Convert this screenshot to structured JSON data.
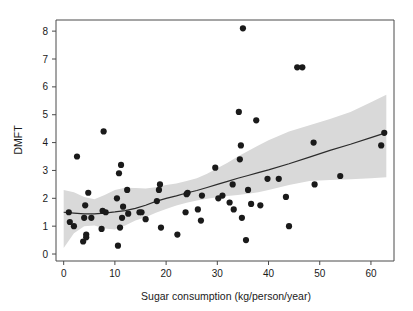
{
  "chart_data": {
    "type": "scatter",
    "title": "",
    "subtitle": "",
    "xlabel": "Sugar consumption (kg/person/year)",
    "ylabel": "DMFT",
    "xlim": [
      -1.5,
      64.5
    ],
    "ylim": [
      -0.25,
      8.4
    ],
    "xticks": [
      0,
      10,
      20,
      30,
      40,
      50,
      60
    ],
    "yticks": [
      0,
      1,
      2,
      3,
      4,
      5,
      6,
      7,
      8
    ],
    "xtick_labels": [
      "0",
      "10",
      "20",
      "30",
      "40",
      "50",
      "60"
    ],
    "ytick_labels": [
      "0",
      "1",
      "2",
      "3",
      "4",
      "5",
      "6",
      "7",
      "8"
    ],
    "grid": false,
    "legend": false,
    "legend_position": "none",
    "marker": {
      "shape": "circle",
      "color": "#1a1a1a",
      "size_px": 3.1
    },
    "points": [
      {
        "x": 1.0,
        "y": 1.5
      },
      {
        "x": 1.2,
        "y": 1.15
      },
      {
        "x": 2.0,
        "y": 1.0
      },
      {
        "x": 2.6,
        "y": 3.5
      },
      {
        "x": 3.8,
        "y": 0.45
      },
      {
        "x": 4.0,
        "y": 1.3
      },
      {
        "x": 4.2,
        "y": 1.75
      },
      {
        "x": 4.4,
        "y": 0.7
      },
      {
        "x": 4.4,
        "y": 0.6
      },
      {
        "x": 4.8,
        "y": 2.2
      },
      {
        "x": 5.4,
        "y": 1.3
      },
      {
        "x": 7.4,
        "y": 0.9
      },
      {
        "x": 7.6,
        "y": 1.55
      },
      {
        "x": 7.8,
        "y": 4.4
      },
      {
        "x": 8.2,
        "y": 1.5
      },
      {
        "x": 10.4,
        "y": 2.0
      },
      {
        "x": 10.6,
        "y": 0.3
      },
      {
        "x": 10.8,
        "y": 2.9
      },
      {
        "x": 11.0,
        "y": 0.95
      },
      {
        "x": 11.2,
        "y": 3.2
      },
      {
        "x": 11.4,
        "y": 1.3
      },
      {
        "x": 11.6,
        "y": 1.7
      },
      {
        "x": 12.4,
        "y": 2.3
      },
      {
        "x": 12.6,
        "y": 1.45
      },
      {
        "x": 14.8,
        "y": 1.5
      },
      {
        "x": 15.2,
        "y": 1.5
      },
      {
        "x": 16.0,
        "y": 1.25
      },
      {
        "x": 18.2,
        "y": 1.9
      },
      {
        "x": 18.6,
        "y": 2.3
      },
      {
        "x": 18.8,
        "y": 2.5
      },
      {
        "x": 19.0,
        "y": 0.95
      },
      {
        "x": 22.2,
        "y": 0.7
      },
      {
        "x": 23.8,
        "y": 1.5
      },
      {
        "x": 24.0,
        "y": 2.15
      },
      {
        "x": 24.2,
        "y": 2.2
      },
      {
        "x": 26.2,
        "y": 1.6
      },
      {
        "x": 26.8,
        "y": 1.2
      },
      {
        "x": 27.0,
        "y": 2.1
      },
      {
        "x": 29.6,
        "y": 3.1
      },
      {
        "x": 30.2,
        "y": 2.0
      },
      {
        "x": 31.0,
        "y": 2.1
      },
      {
        "x": 32.4,
        "y": 1.85
      },
      {
        "x": 33.0,
        "y": 2.5
      },
      {
        "x": 33.2,
        "y": 1.6
      },
      {
        "x": 34.2,
        "y": 5.1
      },
      {
        "x": 34.4,
        "y": 3.4
      },
      {
        "x": 34.6,
        "y": 3.9
      },
      {
        "x": 34.8,
        "y": 1.3
      },
      {
        "x": 35.0,
        "y": 8.1
      },
      {
        "x": 35.6,
        "y": 0.5
      },
      {
        "x": 36.0,
        "y": 2.3
      },
      {
        "x": 36.6,
        "y": 1.8
      },
      {
        "x": 37.6,
        "y": 4.8
      },
      {
        "x": 38.4,
        "y": 1.75
      },
      {
        "x": 39.8,
        "y": 2.7
      },
      {
        "x": 42.0,
        "y": 2.7
      },
      {
        "x": 43.4,
        "y": 2.05
      },
      {
        "x": 44.0,
        "y": 1.0
      },
      {
        "x": 45.6,
        "y": 6.7
      },
      {
        "x": 46.6,
        "y": 6.7
      },
      {
        "x": 48.8,
        "y": 4.0
      },
      {
        "x": 49.0,
        "y": 2.5
      },
      {
        "x": 54.0,
        "y": 2.8
      },
      {
        "x": 62.0,
        "y": 3.9
      },
      {
        "x": 62.6,
        "y": 4.35
      }
    ],
    "fit_curve": {
      "name": "loess-fit",
      "color": "#2b2b2b",
      "points": [
        {
          "x": 0.0,
          "y": 1.5
        },
        {
          "x": 2.0,
          "y": 1.47
        },
        {
          "x": 4.0,
          "y": 1.44
        },
        {
          "x": 6.0,
          "y": 1.44
        },
        {
          "x": 8.0,
          "y": 1.47
        },
        {
          "x": 10.0,
          "y": 1.51
        },
        {
          "x": 12.0,
          "y": 1.56
        },
        {
          "x": 14.0,
          "y": 1.64
        },
        {
          "x": 16.0,
          "y": 1.75
        },
        {
          "x": 18.0,
          "y": 1.89
        },
        {
          "x": 20.0,
          "y": 2.0
        },
        {
          "x": 22.0,
          "y": 2.09
        },
        {
          "x": 24.0,
          "y": 2.19
        },
        {
          "x": 26.0,
          "y": 2.28
        },
        {
          "x": 28.0,
          "y": 2.39
        },
        {
          "x": 30.0,
          "y": 2.5
        },
        {
          "x": 32.0,
          "y": 2.61
        },
        {
          "x": 34.0,
          "y": 2.72
        },
        {
          "x": 36.0,
          "y": 2.82
        },
        {
          "x": 38.0,
          "y": 2.92
        },
        {
          "x": 40.0,
          "y": 3.02
        },
        {
          "x": 44.0,
          "y": 3.24
        },
        {
          "x": 48.0,
          "y": 3.48
        },
        {
          "x": 52.0,
          "y": 3.72
        },
        {
          "x": 56.0,
          "y": 3.94
        },
        {
          "x": 60.0,
          "y": 4.18
        },
        {
          "x": 63.0,
          "y": 4.36
        }
      ]
    },
    "confidence_band": {
      "name": "confidence-band",
      "color": "#d9d9d9",
      "upper": [
        {
          "x": 0.0,
          "y": 2.3
        },
        {
          "x": 2.0,
          "y": 2.22
        },
        {
          "x": 4.0,
          "y": 2.05
        },
        {
          "x": 6.0,
          "y": 1.97
        },
        {
          "x": 8.0,
          "y": 2.12
        },
        {
          "x": 10.0,
          "y": 2.3
        },
        {
          "x": 12.0,
          "y": 2.38
        },
        {
          "x": 14.0,
          "y": 2.37
        },
        {
          "x": 16.0,
          "y": 2.35
        },
        {
          "x": 18.0,
          "y": 2.4
        },
        {
          "x": 20.0,
          "y": 2.48
        },
        {
          "x": 22.0,
          "y": 2.53
        },
        {
          "x": 24.0,
          "y": 2.62
        },
        {
          "x": 26.0,
          "y": 2.72
        },
        {
          "x": 28.0,
          "y": 2.88
        },
        {
          "x": 30.0,
          "y": 3.08
        },
        {
          "x": 32.0,
          "y": 3.28
        },
        {
          "x": 34.0,
          "y": 3.5
        },
        {
          "x": 36.0,
          "y": 3.7
        },
        {
          "x": 38.0,
          "y": 3.9
        },
        {
          "x": 40.0,
          "y": 4.08
        },
        {
          "x": 44.0,
          "y": 4.4
        },
        {
          "x": 48.0,
          "y": 4.62
        },
        {
          "x": 52.0,
          "y": 4.85
        },
        {
          "x": 56.0,
          "y": 5.1
        },
        {
          "x": 60.0,
          "y": 5.45
        },
        {
          "x": 63.0,
          "y": 5.72
        }
      ],
      "lower": [
        {
          "x": 0.0,
          "y": 0.22
        },
        {
          "x": 2.0,
          "y": 0.75
        },
        {
          "x": 4.0,
          "y": 1.0
        },
        {
          "x": 6.0,
          "y": 1.02
        },
        {
          "x": 8.0,
          "y": 0.92
        },
        {
          "x": 10.0,
          "y": 0.88
        },
        {
          "x": 12.0,
          "y": 1.02
        },
        {
          "x": 14.0,
          "y": 1.2
        },
        {
          "x": 16.0,
          "y": 1.32
        },
        {
          "x": 18.0,
          "y": 1.48
        },
        {
          "x": 20.0,
          "y": 1.62
        },
        {
          "x": 22.0,
          "y": 1.74
        },
        {
          "x": 24.0,
          "y": 1.84
        },
        {
          "x": 26.0,
          "y": 1.92
        },
        {
          "x": 28.0,
          "y": 1.98
        },
        {
          "x": 30.0,
          "y": 2.04
        },
        {
          "x": 32.0,
          "y": 2.08
        },
        {
          "x": 34.0,
          "y": 2.12
        },
        {
          "x": 36.0,
          "y": 2.16
        },
        {
          "x": 38.0,
          "y": 2.22
        },
        {
          "x": 40.0,
          "y": 2.3
        },
        {
          "x": 44.0,
          "y": 2.48
        },
        {
          "x": 48.0,
          "y": 2.62
        },
        {
          "x": 52.0,
          "y": 2.66
        },
        {
          "x": 56.0,
          "y": 2.68
        },
        {
          "x": 60.0,
          "y": 2.72
        },
        {
          "x": 63.0,
          "y": 2.76
        }
      ]
    }
  }
}
